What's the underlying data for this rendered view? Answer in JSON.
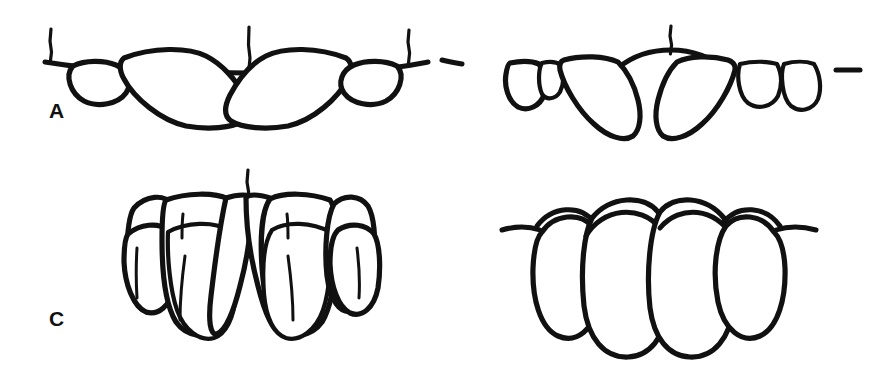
{
  "figure": {
    "background_color": "#ffffff",
    "line_color": "#111111",
    "width": 874,
    "height": 368
  },
  "panels": [
    {
      "id": "A",
      "label": "A",
      "caption": "Lingually inclined / flared anterior teeth with open occlusal line",
      "midline_marker": "vertical-tick",
      "arch_shape": "wide-shallow-v",
      "tooth_count": 6,
      "midline_contact": "closed",
      "reference_ticks": 3
    },
    {
      "id": "B",
      "label": "B",
      "caption": "Large midline diastema with arched edentulous span",
      "midline_marker": "vertical-tick",
      "arch_shape": "peaked-arch-gap",
      "tooth_count": 6,
      "midline_contact": "open-diastema",
      "reference_ticks": 1
    },
    {
      "id": "C",
      "label": "C",
      "caption": "Crowded overlapping incisors viewed labially",
      "midline_marker": "vertical-tick",
      "arch_shape": "crowded-overlap",
      "tooth_count": 6,
      "midline_contact": "closed",
      "reference_ticks": 1
    },
    {
      "id": "D",
      "label": "D",
      "caption": "Well aligned incisors with small midline triangular space",
      "midline_marker": "vertical-tick",
      "arch_shape": "even-aligned",
      "tooth_count": 6,
      "midline_contact": "small-triangular-space",
      "reference_ticks": 1
    }
  ],
  "colors": {
    "ink": "#111111",
    "paper": "#ffffff"
  }
}
